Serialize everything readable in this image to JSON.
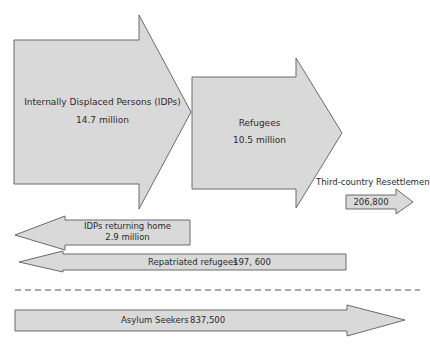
{
  "diagram": {
    "colors": {
      "arrow_fill": "#d9d9d9",
      "arrow_stroke": "#6a6a6a",
      "text": "#2b2b2b"
    },
    "idps": {
      "label": "Internally Displaced Persons (IDPs)",
      "value": "14.7 million",
      "direction": "right"
    },
    "refugees": {
      "label": "Refugees",
      "value": "10.5 million",
      "direction": "right"
    },
    "resettlement": {
      "label": "Third-country Resettlement",
      "value": "206,800",
      "direction": "right"
    },
    "idps_returning": {
      "label": "IDPs returning home",
      "value": "2.9 million",
      "direction": "left"
    },
    "repatriated": {
      "label": "Repatriated refugees",
      "value": "197, 600",
      "direction": "left"
    },
    "asylum": {
      "label": "Asylum Seekers",
      "value": "837,500",
      "direction": "right"
    },
    "separator": "dashed-line"
  }
}
